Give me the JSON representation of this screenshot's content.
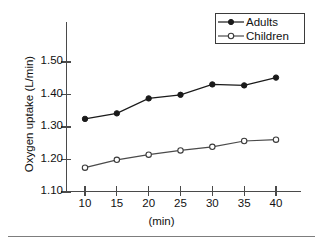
{
  "chart_data": {
    "type": "line",
    "title": "",
    "xlabel": "(min)",
    "ylabel": "Oxygen uptake (L/min)",
    "x": [
      10,
      15,
      20,
      25,
      30,
      35,
      40
    ],
    "xtick_labels": [
      "10",
      "15",
      "20",
      "25",
      "30",
      "35",
      "40"
    ],
    "ytick_labels": [
      "1.50",
      "1.40",
      "1.30",
      "1.20",
      "1.10"
    ],
    "ytick_values": [
      1.5,
      1.4,
      1.3,
      1.2,
      1.1
    ],
    "ylim": [
      1.1,
      1.55
    ],
    "xlim": [
      6.5,
      45
    ],
    "grid": false,
    "legend_position": "top-right",
    "series": [
      {
        "name": "Adults",
        "marker": "filled-circle",
        "color": "#1a1a1a",
        "values": [
          1.325,
          1.342,
          1.388,
          1.399,
          1.431,
          1.428,
          1.452
        ]
      },
      {
        "name": "Children",
        "marker": "open-circle",
        "color": "#4a4a4a",
        "values": [
          1.175,
          1.199,
          1.215,
          1.228,
          1.239,
          1.257,
          1.261
        ]
      }
    ]
  },
  "legend": {
    "entries": [
      {
        "label": "Adults"
      },
      {
        "label": "Children"
      }
    ]
  },
  "axes": {
    "y_title": "Oxygen uptake (L/min)",
    "x_title": "(min)"
  }
}
